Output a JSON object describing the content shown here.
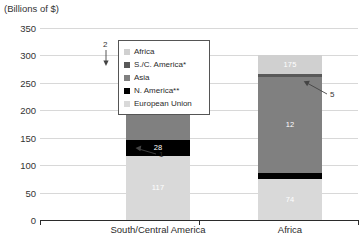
{
  "chart_data": {
    "type": "bar",
    "title": "(Billions of $)",
    "xlabel": "",
    "ylabel": "(Billions of $)",
    "ylim": [
      0,
      350
    ],
    "yticks": [
      "0",
      "50",
      "100",
      "150",
      "200",
      "250",
      "300",
      "350"
    ],
    "grid": true,
    "stacked": true,
    "legend_position": "inside-top-center",
    "categories": [
      "South/Central America",
      "Africa"
    ],
    "series": [
      {
        "name": "European Union",
        "values": [
          117,
          74
        ],
        "color": "#d9d9d9"
      },
      {
        "name": "N. America**",
        "values": [
          28,
          12
        ],
        "color": "#000000"
      },
      {
        "name": "Asia",
        "values": [
          138,
          175
        ],
        "color": "#808080"
      },
      {
        "name": "S./C. America*",
        "values": [
          2,
          5
        ],
        "color": "#595959"
      },
      {
        "name": "Africa",
        "values": [
          0,
          35
        ],
        "color": "#d0d0d0"
      }
    ],
    "bar_totals": [
      285,
      296
    ],
    "data_labels": {
      "south_central_america": [
        "117",
        "28",
        "138"
      ],
      "africa": [
        "74",
        "12",
        "175",
        "35"
      ]
    },
    "annotations": [
      {
        "text": "2",
        "target": "S./C. America sliver on South/Central America bar"
      },
      {
        "text": "1",
        "target": "N. America band on South/Central America bar"
      },
      {
        "text": "5",
        "target": "S./C. America sliver on Africa bar"
      }
    ]
  },
  "legend": {
    "items": [
      {
        "label": "Africa",
        "color": "#d0d0d0"
      },
      {
        "label": "S./C. America*",
        "color": "#595959"
      },
      {
        "label": "Asia",
        "color": "#808080"
      },
      {
        "label": "N. America**",
        "color": "#000000"
      },
      {
        "label": "European Union",
        "color": "#d9d9d9"
      }
    ]
  }
}
